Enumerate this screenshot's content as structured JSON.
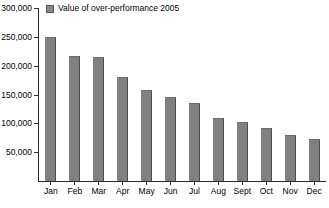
{
  "legend": {
    "position": "top-left",
    "swatch_color": "#8a8a8a",
    "entries": [
      {
        "label": "Value of over-performance 2005"
      }
    ]
  },
  "axes": {
    "y_tick_labels": [
      "300,000",
      "250,000",
      "200,000",
      "150,000",
      "100,000",
      "50,000"
    ],
    "x_tick_labels": [
      "Jan",
      "Feb",
      "Mar",
      "Apr",
      "May",
      "Jun",
      "Jul",
      "Aug",
      "Sept",
      "Oct",
      "Nov",
      "Dec"
    ]
  },
  "caption": {
    "text": ""
  },
  "colors": {
    "bar": "#808080",
    "bar_edge": "#4f4f4f",
    "axis": "#2b2b2b",
    "background": "#ffffff"
  },
  "chart_data": {
    "type": "bar",
    "title": "",
    "subtitle": "",
    "xlabel": "",
    "ylabel": "",
    "categories": [
      "Jan",
      "Feb",
      "Mar",
      "Apr",
      "May",
      "Jun",
      "Jul",
      "Aug",
      "Sept",
      "Oct",
      "Nov",
      "Dec"
    ],
    "series": [
      {
        "name": "Value of over-performance 2005",
        "color": "#808080",
        "values": [
          250000,
          217000,
          215000,
          180000,
          158000,
          145000,
          135000,
          110000,
          103000,
          92000,
          80000,
          72000
        ]
      }
    ],
    "ylim": [
      0,
      300000
    ],
    "ytick_values": [
      300000,
      250000,
      200000,
      150000,
      100000,
      50000
    ],
    "ytick_labels": [
      "300,000",
      "250,000",
      "200,000",
      "150,000",
      "100,000",
      "50,000"
    ],
    "grid": false,
    "legend_position": "top-left",
    "orientation": "vertical"
  }
}
